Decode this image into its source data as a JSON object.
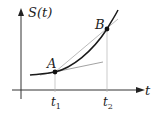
{
  "diagram": {
    "y_axis_label": "S(t)",
    "x_axis_label": "t",
    "points": [
      {
        "label": "A",
        "tick_label": "t",
        "tick_sub": "1"
      },
      {
        "label": "B",
        "tick_label": "t",
        "tick_sub": "2"
      }
    ],
    "elements": [
      "curve S(t)",
      "tangent line at A",
      "secant line AB",
      "projection lines to t-axis"
    ],
    "colors": {
      "curve": "#1a1a1a",
      "axis": "#333333",
      "aux_line": "#9a9a9a"
    }
  }
}
